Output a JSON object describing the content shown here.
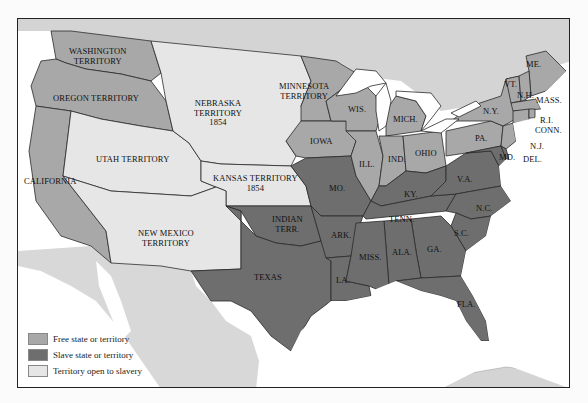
{
  "colors": {
    "free": "#a8a8a8",
    "slave": "#6e6e6e",
    "open": "#e6e6e6",
    "foreign": "#d4d4d4",
    "water": "#ffffff",
    "border": "#2a2a2a"
  },
  "labels": {
    "washington": [
      "WASHINGTON",
      "TERRITORY"
    ],
    "oregon": "OREGON TERRITORY",
    "nebraska": [
      "NEBRASKA",
      "TERRITORY",
      "1854"
    ],
    "minnesota": [
      "MINNESOTA",
      "TERRITORY"
    ],
    "california": "CALIFORNIA",
    "utah": "UTAH TERRITORY",
    "kansas": [
      "KANSAS TERRITORY",
      "1854"
    ],
    "new_mexico": [
      "NEW MEXICO",
      "TERRITORY"
    ],
    "indian": [
      "INDIAN",
      "TERR."
    ],
    "texas": "TEXAS",
    "wis": "WIS.",
    "mich": "MICH.",
    "iowa": "IOWA",
    "ill": "ILL.",
    "ind": "IND.",
    "ohio": "OHIO",
    "mo": "MO.",
    "ky": "KY.",
    "va": "V.A.",
    "tenn": "TENN.",
    "nc": "N.C.",
    "ark": "ARK.",
    "sc": "S.C.",
    "miss": "MISS.",
    "ala": "ALA.",
    "ga": "GA.",
    "la": "LA.",
    "fla": "FLA.",
    "ny": "N.Y.",
    "pa": "PA.",
    "me": "ME.",
    "vt": "VT.",
    "nh": "N.H.",
    "mass": "MASS.",
    "ri": "R.I.",
    "conn": "CONN.",
    "nj": "N.J.",
    "md": "MD.",
    "del": "DEL."
  },
  "legend": [
    {
      "label": "Free state or territory",
      "key": "free"
    },
    {
      "label": "Slave state or territory",
      "key": "slave"
    },
    {
      "label": "Territory open to slavery",
      "key": "open"
    }
  ]
}
